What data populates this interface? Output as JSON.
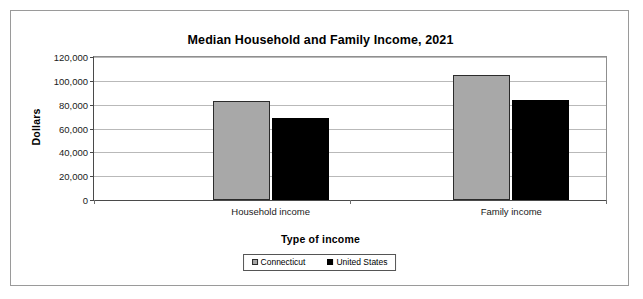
{
  "chart_data": {
    "type": "bar",
    "title": "Median Household and Family Income, 2021",
    "xlabel": "Type of income",
    "ylabel": "Dollars",
    "categories": [
      "Household income",
      "Family income"
    ],
    "series": [
      {
        "name": "Connecticut",
        "values": [
          83000,
          105000
        ],
        "color": "#a8a8a8"
      },
      {
        "name": "United States",
        "values": [
          69000,
          84000
        ],
        "color": "#000000"
      }
    ],
    "ylim": [
      0,
      120000
    ],
    "ytick_values": [
      0,
      20000,
      40000,
      60000,
      80000,
      100000,
      120000
    ],
    "ytick_labels": [
      "0",
      "20,000",
      "40,000",
      "60,000",
      "80,000",
      "100,000",
      "120,000"
    ],
    "grid": true,
    "legend_position": "bottom"
  },
  "legend": {
    "items": [
      {
        "label": "Connecticut"
      },
      {
        "label": "United States"
      }
    ]
  }
}
